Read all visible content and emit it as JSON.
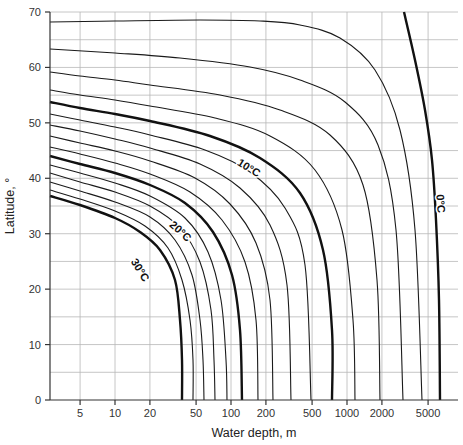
{
  "chart_data": {
    "type": "line",
    "title": "",
    "xlabel": "Water depth, m",
    "ylabel": "Latitude, °",
    "xscale": "log",
    "xlim": [
      2.75,
      9000
    ],
    "ylim": [
      0,
      70
    ],
    "x_ticks": [
      5,
      10,
      20,
      50,
      100,
      200,
      500,
      1000,
      2000,
      5000
    ],
    "x_tick_labels": [
      "5",
      "10",
      "20",
      "50",
      "100",
      "200",
      "500",
      "1000",
      "2000",
      "5000"
    ],
    "x_gridlines": [
      5,
      10,
      20,
      50,
      100,
      200,
      500,
      1000,
      2000,
      5000
    ],
    "y_ticks": [
      0,
      10,
      20,
      30,
      40,
      50,
      60,
      70
    ],
    "y_tick_labels": [
      "0",
      "10",
      "20",
      "30",
      "40",
      "50",
      "60",
      "70"
    ],
    "y_gridline_step": 5,
    "grid": true,
    "legend": "none (inline contour labels)",
    "series": [
      {
        "name": "30°C",
        "bold": true,
        "label": "30°C",
        "lat_at_left": 37.0,
        "depth_at_equator": 39
      },
      {
        "name": "28°C",
        "bold": false,
        "lat_at_left": 38.1,
        "depth_at_equator": 48
      },
      {
        "name": "26°C",
        "bold": false,
        "lat_at_left": 39.5,
        "depth_at_equator": 59
      },
      {
        "name": "24°C",
        "bold": false,
        "lat_at_left": 41.2,
        "depth_at_equator": 73
      },
      {
        "name": "22°C",
        "bold": false,
        "lat_at_left": 42.6,
        "depth_at_equator": 92
      },
      {
        "name": "20°C",
        "bold": true,
        "label": "20°C",
        "lat_at_left": 44.2,
        "depth_at_equator": 124
      },
      {
        "name": "18°C",
        "bold": false,
        "lat_at_left": 45.8,
        "depth_at_equator": 170
      },
      {
        "name": "16°C",
        "bold": false,
        "lat_at_left": 47.8,
        "depth_at_equator": 230
      },
      {
        "name": "14°C",
        "bold": false,
        "lat_at_left": 49.8,
        "depth_at_equator": 330
      },
      {
        "name": "12°C",
        "bold": false,
        "lat_at_left": 51.7,
        "depth_at_equator": 490
      },
      {
        "name": "10°C",
        "bold": true,
        "label": "10°C",
        "lat_at_left": 53.9,
        "depth_at_equator": 740
      },
      {
        "name": "8°C",
        "bold": false,
        "lat_at_left": 56.0,
        "depth_at_equator": 1160
      },
      {
        "name": "6°C",
        "bold": false,
        "lat_at_left": 59.2,
        "depth_at_equator": 1900
      },
      {
        "name": "4°C",
        "bold": false,
        "lat_at_left": 63.0,
        "depth_at_equator": 2960
      },
      {
        "name": "2°C",
        "bold": false,
        "lat_at_left": 68.0,
        "depth_at_equator": 4100
      },
      {
        "name": "0°C",
        "bold": true,
        "label": "0°C",
        "lat_at_top": 70,
        "depth_at_top": 2550,
        "depth_at_equator": 5800
      }
    ],
    "annotations": [
      "30°C",
      "20°C",
      "10°C",
      "0°C"
    ]
  },
  "labels": {
    "xlabel": "Water depth, m",
    "ylabel": "Latitude, °",
    "c30": "30°C",
    "c20": "20°C",
    "c10": "10°C",
    "c0": "0°C"
  },
  "render": {
    "plot": {
      "left": 50,
      "right": 458,
      "top": 12,
      "bottom": 400
    },
    "x_px_per_decade": 116,
    "x_px_at_10": 115,
    "curves_px": [
      {
        "bold": true,
        "pts": [
          [
            50,
            196
          ],
          [
            80,
            205
          ],
          [
            115,
            218
          ],
          [
            140,
            232
          ],
          [
            160,
            250
          ],
          [
            175,
            280
          ],
          [
            180,
            320
          ],
          [
            182,
            360
          ],
          [
            182,
            400
          ]
        ]
      },
      {
        "bold": false,
        "pts": [
          [
            50,
            190
          ],
          [
            80,
            199
          ],
          [
            115,
            211
          ],
          [
            145,
            226
          ],
          [
            168,
            248
          ],
          [
            182,
            280
          ],
          [
            190,
            320
          ],
          [
            193,
            360
          ],
          [
            193,
            400
          ]
        ]
      },
      {
        "bold": false,
        "pts": [
          [
            50,
            182
          ],
          [
            80,
            191
          ],
          [
            115,
            202
          ],
          [
            150,
            217
          ],
          [
            175,
            240
          ],
          [
            192,
            275
          ],
          [
            200,
            320
          ],
          [
            203,
            360
          ],
          [
            204,
            400
          ]
        ]
      },
      {
        "bold": false,
        "pts": [
          [
            50,
            173
          ],
          [
            80,
            182
          ],
          [
            115,
            192
          ],
          [
            150,
            206
          ],
          [
            180,
            228
          ],
          [
            200,
            262
          ],
          [
            211,
            310
          ],
          [
            214,
            360
          ],
          [
            215,
            400
          ]
        ]
      },
      {
        "bold": false,
        "pts": [
          [
            50,
            165
          ],
          [
            80,
            173
          ],
          [
            115,
            183
          ],
          [
            150,
            196
          ],
          [
            185,
            218
          ],
          [
            208,
            252
          ],
          [
            221,
            300
          ],
          [
            226,
            360
          ],
          [
            227,
            400
          ]
        ]
      },
      {
        "bold": true,
        "pts": [
          [
            50,
            156
          ],
          [
            80,
            164
          ],
          [
            115,
            173
          ],
          [
            150,
            185
          ],
          [
            185,
            203
          ],
          [
            213,
            232
          ],
          [
            232,
            275
          ],
          [
            240,
            330
          ],
          [
            242,
            400
          ]
        ]
      },
      {
        "bold": false,
        "pts": [
          [
            50,
            147
          ],
          [
            80,
            154
          ],
          [
            115,
            163
          ],
          [
            150,
            174
          ],
          [
            190,
            192
          ],
          [
            222,
            220
          ],
          [
            245,
            262
          ],
          [
            256,
            320
          ],
          [
            258,
            400
          ]
        ]
      },
      {
        "bold": false,
        "pts": [
          [
            50,
            136
          ],
          [
            80,
            143
          ],
          [
            115,
            151
          ],
          [
            150,
            161
          ],
          [
            195,
            178
          ],
          [
            230,
            204
          ],
          [
            256,
            243
          ],
          [
            270,
            300
          ],
          [
            273,
            400
          ]
        ]
      },
      {
        "bold": false,
        "pts": [
          [
            50,
            125
          ],
          [
            80,
            131
          ],
          [
            115,
            139
          ],
          [
            150,
            148
          ],
          [
            200,
            164
          ],
          [
            240,
            188
          ],
          [
            270,
            225
          ],
          [
            287,
            285
          ],
          [
            291,
            400
          ]
        ]
      },
      {
        "bold": false,
        "pts": [
          [
            50,
            114
          ],
          [
            80,
            120
          ],
          [
            115,
            127
          ],
          [
            150,
            135
          ],
          [
            205,
            150
          ],
          [
            250,
            172
          ],
          [
            285,
            208
          ],
          [
            305,
            265
          ],
          [
            311,
            400
          ]
        ]
      },
      {
        "bold": true,
        "pts": [
          [
            50,
            102
          ],
          [
            80,
            108
          ],
          [
            115,
            114
          ],
          [
            150,
            121
          ],
          [
            210,
            136
          ],
          [
            260,
            158
          ],
          [
            300,
            193
          ],
          [
            323,
            250
          ],
          [
            332,
            330
          ],
          [
            332,
            400
          ]
        ]
      },
      {
        "bold": false,
        "pts": [
          [
            50,
            90
          ],
          [
            80,
            95
          ],
          [
            115,
            100
          ],
          [
            150,
            106
          ],
          [
            215,
            118
          ],
          [
            270,
            136
          ],
          [
            315,
            170
          ],
          [
            342,
            230
          ],
          [
            353,
            320
          ],
          [
            355,
            400
          ]
        ]
      },
      {
        "bold": false,
        "pts": [
          [
            50,
            72
          ],
          [
            80,
            76
          ],
          [
            115,
            80
          ],
          [
            150,
            85
          ],
          [
            220,
            95
          ],
          [
            280,
            110
          ],
          [
            330,
            135
          ],
          [
            363,
            185
          ],
          [
            377,
            280
          ],
          [
            380,
            400
          ]
        ]
      },
      {
        "bold": false,
        "pts": [
          [
            50,
            49
          ],
          [
            115,
            53
          ],
          [
            180,
            58
          ],
          [
            250,
            67
          ],
          [
            300,
            80
          ],
          [
            345,
            102
          ],
          [
            378,
            145
          ],
          [
            396,
            230
          ],
          [
            403,
            400
          ]
        ]
      },
      {
        "bold": false,
        "pts": [
          [
            50,
            22
          ],
          [
            115,
            21
          ],
          [
            200,
            20
          ],
          [
            260,
            21
          ],
          [
            300,
            25
          ],
          [
            340,
            38
          ],
          [
            375,
            70
          ],
          [
            400,
            130
          ],
          [
            415,
            230
          ],
          [
            422,
            400
          ]
        ]
      },
      {
        "bold": true,
        "pts": [
          [
            404,
            12
          ],
          [
            415,
            60
          ],
          [
            425,
            110
          ],
          [
            432,
            160
          ],
          [
            436,
            220
          ],
          [
            439,
            300
          ],
          [
            440,
            400
          ]
        ]
      }
    ],
    "label_pos": {
      "c30": {
        "x": 137,
        "y": 272,
        "rot": 58
      },
      "c20": {
        "x": 178,
        "y": 234,
        "rot": 42
      },
      "c10": {
        "x": 247,
        "y": 171,
        "rot": 32
      },
      "c0": {
        "x": 437,
        "y": 204,
        "rot": 85
      }
    }
  }
}
